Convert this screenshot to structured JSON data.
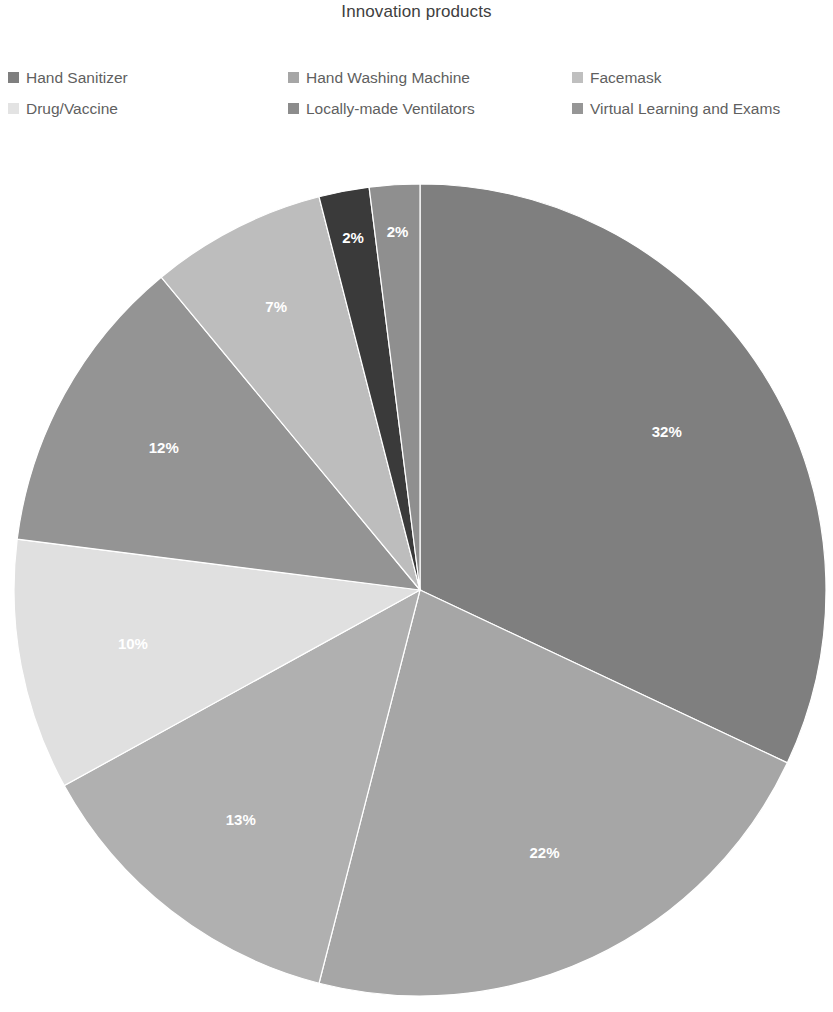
{
  "chart": {
    "title": "Innovation products"
  },
  "legend": {
    "columns": [
      {
        "items": [
          {
            "label": "Hand Sanitizer",
            "color": "#7f7f7f"
          },
          {
            "label": "Drug/Vaccine",
            "color": "#e3e3e3"
          }
        ]
      },
      {
        "items": [
          {
            "label": "Hand Washing Machine",
            "color": "#a6a6a6"
          },
          {
            "label": "Locally-made Ventilators",
            "color": "#8c8c8c"
          }
        ]
      },
      {
        "items": [
          {
            "label": "Facemask",
            "color": "#bfbfbf"
          },
          {
            "label": "Virtual Learning and Exams",
            "color": "#969696"
          }
        ]
      }
    ]
  },
  "chart_data": {
    "type": "pie",
    "title": "Innovation products",
    "legend_position": "top",
    "labels_inside": true,
    "label_format": "percent",
    "center": {
      "x": 420,
      "y": 590
    },
    "radius": 406,
    "start_angle_deg": -90,
    "direction": "clockwise",
    "categories": [
      "Hand Sanitizer",
      "Hand Washing Machine",
      "Facemask",
      "Drug/Vaccine",
      "Locally-made Ventilators",
      "Virtual Learning and Exams",
      "Other A",
      "Other B"
    ],
    "values": [
      32,
      22,
      13,
      10,
      12,
      7,
      2,
      2
    ],
    "value_labels": [
      "32%",
      "22%",
      "13%",
      "10%",
      "12%",
      "7%",
      "2%",
      "2%"
    ],
    "slices": [
      {
        "name": "Hand Sanitizer",
        "value": 32,
        "label": "32%",
        "color": "#7f7f7f"
      },
      {
        "name": "Hand Washing Machine",
        "value": 22,
        "label": "22%",
        "color": "#a6a6a6"
      },
      {
        "name": "Facemask",
        "value": 13,
        "label": "13%",
        "color": "#b0b0b0"
      },
      {
        "name": "Drug/Vaccine",
        "value": 10,
        "label": "10%",
        "color": "#e0e0e0"
      },
      {
        "name": "Locally-made Ventilators",
        "value": 12,
        "label": "12%",
        "color": "#949494"
      },
      {
        "name": "Virtual Learning and Exams",
        "value": 7,
        "label": "7%",
        "color": "#bdbdbd"
      },
      {
        "name": "Other A",
        "value": 2,
        "label": "2%",
        "color": "#3a3a3a"
      },
      {
        "name": "Other B",
        "value": 2,
        "label": "2%",
        "color": "#8f8f8f"
      }
    ]
  }
}
